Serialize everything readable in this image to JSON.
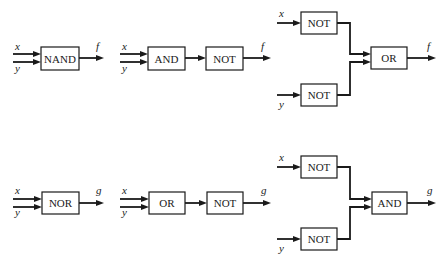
{
  "diagram": {
    "rows": [
      {
        "output_label": "f",
        "circuits": [
          {
            "name": "nand-circuit",
            "inputs": [
              "x",
              "y"
            ],
            "gates": [
              "NAND"
            ],
            "output": "f"
          },
          {
            "name": "and-not-circuit",
            "inputs": [
              "x",
              "y"
            ],
            "gates": [
              "AND",
              "NOT"
            ],
            "output": "f"
          },
          {
            "name": "not-not-or-circuit",
            "inputs": [
              "x",
              "y"
            ],
            "gates": [
              "NOT",
              "NOT",
              "OR"
            ],
            "output": "f"
          }
        ]
      },
      {
        "output_label": "g",
        "circuits": [
          {
            "name": "nor-circuit",
            "inputs": [
              "x",
              "y"
            ],
            "gates": [
              "NOR"
            ],
            "output": "g"
          },
          {
            "name": "or-not-circuit",
            "inputs": [
              "x",
              "y"
            ],
            "gates": [
              "OR",
              "NOT"
            ],
            "output": "g"
          },
          {
            "name": "not-not-and-circuit",
            "inputs": [
              "x",
              "y"
            ],
            "gates": [
              "NOT",
              "NOT",
              "AND"
            ],
            "output": "g"
          }
        ]
      }
    ]
  },
  "labels": {
    "x": "x",
    "y": "y",
    "f": "f",
    "g": "g",
    "nand": "NAND",
    "and": "AND",
    "not": "NOT",
    "or": "OR",
    "nor": "NOR"
  },
  "colors": {
    "ink": "#1a1a1a",
    "background": "#ffffff"
  }
}
